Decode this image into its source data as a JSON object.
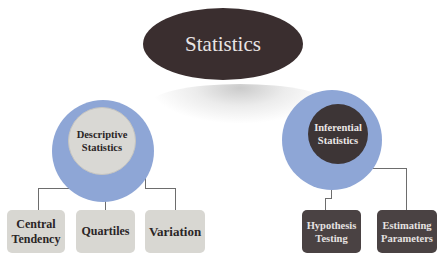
{
  "diagram": {
    "title": "Statistics",
    "branches": [
      {
        "label_line1": "Descriptive",
        "label_line2": "Statistics",
        "style": "light",
        "children": [
          {
            "line1": "Central",
            "line2": "Tendency"
          },
          {
            "line1": "Quartiles",
            "line2": ""
          },
          {
            "line1": "Variation",
            "line2": ""
          }
        ]
      },
      {
        "label_line1": "Inferential",
        "label_line2": "Statistics",
        "style": "dark",
        "children": [
          {
            "line1": "Hypothesis",
            "line2": "Testing"
          },
          {
            "line1": "Estimating",
            "line2": "Parameters"
          }
        ]
      }
    ],
    "colors": {
      "title_fill": "#3a2e2f",
      "ring": "#8ea6d6",
      "light_fill": "#d8d7d2",
      "dark_fill": "#4a4243",
      "connector": "#6d6d6d"
    }
  }
}
